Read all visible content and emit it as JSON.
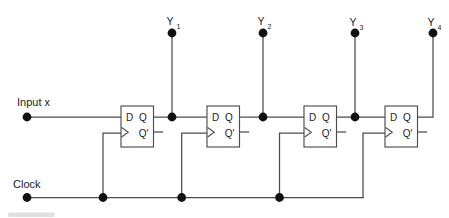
{
  "diagram": {
    "kind": "logic-circuit",
    "input_label": "Input x",
    "clock_label": "Clock",
    "pins": {
      "d": "D",
      "q": "Q",
      "qbar": "Q'"
    },
    "outputs": [
      {
        "base": "Y",
        "sub": "1"
      },
      {
        "base": "Y",
        "sub": "2"
      },
      {
        "base": "Y",
        "sub": "3"
      },
      {
        "base": "Y",
        "sub": "4"
      }
    ],
    "colors": {
      "wire": "#4d4d4d",
      "dot": "#111111",
      "text": "#222222",
      "bg": "#ffffff"
    }
  }
}
